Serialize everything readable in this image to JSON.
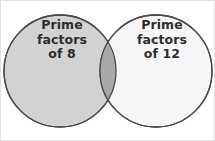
{
  "figure": {
    "type": "venn-diagram-two-set",
    "width": 215,
    "height": 141,
    "background_color": "#ffffff",
    "border_color": "#e2e2e2"
  },
  "colors": {
    "left_circle_fill": "#d2d2d2",
    "right_circle_fill": "#f6f6f6",
    "overlap_fill": "#a9a9a9",
    "circle_stroke": "#4a4a4a",
    "label_text": "#2e2e2e"
  },
  "sets": {
    "left": {
      "name": "prime-factors-of-8",
      "lines": [
        "Prime",
        "factors",
        "of 8"
      ],
      "fill": "#d2d2d2",
      "center_x": 59,
      "center_y": 70,
      "radius": 56
    },
    "right": {
      "name": "prime-factors-of-12",
      "lines": [
        "Prime",
        "factors",
        "of 12"
      ],
      "fill": "#f6f6f6",
      "center_x": 155,
      "center_y": 70,
      "radius": 56
    },
    "intersection": {
      "name": "overlap-region",
      "label": "",
      "fill": "#a9a9a9"
    }
  }
}
